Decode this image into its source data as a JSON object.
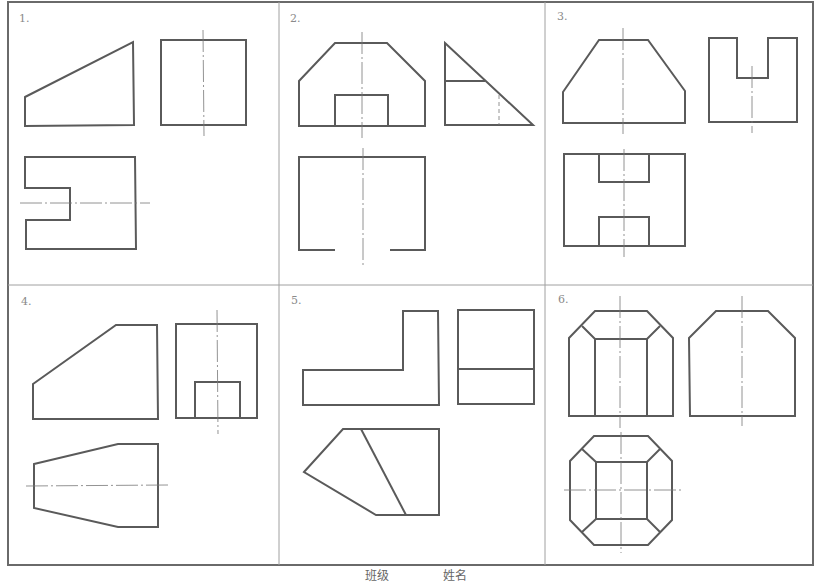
{
  "sheet": {
    "title": "Three-view drawings exercise sheet",
    "footer": {
      "class_label": "班级",
      "name_label": "姓名"
    }
  },
  "problems": [
    {
      "number": "1.",
      "views": [
        "front: trapezoid with sloped top",
        "side: rectangle with vertical centerline",
        "top: rectangle with notch on left, horizontal centerline"
      ]
    },
    {
      "number": "2.",
      "views": [
        "front: chamfered hexagonal outline with rectangular slot at bottom center",
        "side: right triangle with horizontal line and hidden dashed line",
        "top: open-bottom rectangle with vertical centerline"
      ]
    },
    {
      "number": "3.",
      "views": [
        "front: trapezoid-topped shape with vertical centerline",
        "side: U-shape with centered slot",
        "top: rectangle with slots top and bottom center"
      ]
    },
    {
      "number": "4.",
      "views": [
        "front: pentagon with sloped upper-left edge",
        "side: rectangle with inner rectangular notch at bottom",
        "top: tapered hexagon with horizontal centerline"
      ]
    },
    {
      "number": "5.",
      "views": [
        "front: L-shape",
        "side: rectangle divided horizontally",
        "top: irregular pentagon with diagonal line"
      ]
    },
    {
      "number": "6.",
      "views": [
        "front: chamfered prism with inner vertical lines",
        "side: chamfered outline",
        "top: octagon with inner square and connecting lines"
      ]
    }
  ],
  "colors": {
    "line": "#5a5a5a",
    "frame": "#6a6a6a",
    "divider": "#a0a0a0",
    "number_text": "#8a8a8a",
    "background": "#ffffff"
  }
}
